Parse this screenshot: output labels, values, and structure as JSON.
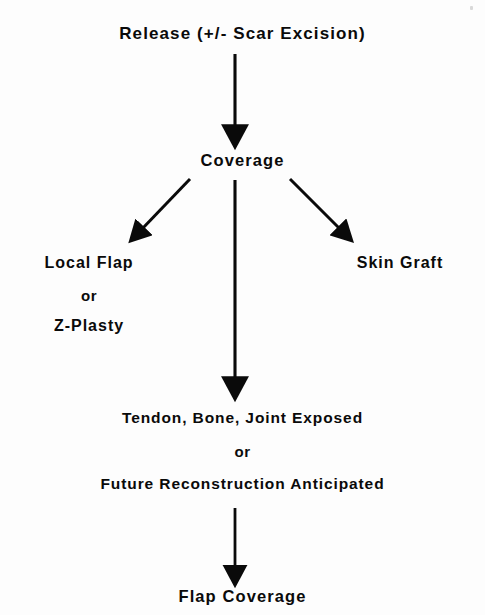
{
  "document": {
    "type": "clinical-algorithm-flowchart",
    "title_text": "Release (+/- Scar Excision)",
    "background_color": "#fdfdfd",
    "ink_color": "#0a0a0a"
  },
  "nodes": {
    "release": {
      "label": "Release (+/- Scar Excision)",
      "center_x": 244,
      "y": 34
    },
    "coverage": {
      "label": "Coverage",
      "center_x": 240,
      "y": 161
    },
    "local_flap": {
      "line1": "Local Flap",
      "line2": "or",
      "line3": "Z-Plasty",
      "center_x": 89,
      "y": 264
    },
    "skin_graft": {
      "label": "Skin Graft",
      "center_x": 400,
      "y": 264
    },
    "exposed": {
      "line1": "Tendon, Bone, Joint Exposed",
      "line2": "or",
      "line3": "Future Reconstruction Anticipated",
      "center_x": 239,
      "y": 418
    },
    "flap_coverage": {
      "label": "Flap Coverage",
      "center_x": 240,
      "y": 596
    }
  },
  "connectors": [
    {
      "name": "release-to-coverage",
      "kind": "vertical-arrow",
      "from": {
        "x": 235,
        "y": 54
      },
      "to": {
        "x": 235,
        "y": 140
      }
    },
    {
      "name": "coverage-to-local-flap",
      "kind": "diagonal-arrow-left",
      "from": {
        "x": 190,
        "y": 179
      },
      "to": {
        "x": 134,
        "y": 238
      }
    },
    {
      "name": "coverage-to-skin-graft",
      "kind": "diagonal-arrow-right",
      "from": {
        "x": 290,
        "y": 179
      },
      "to": {
        "x": 348,
        "y": 238
      }
    },
    {
      "name": "coverage-to-exposed",
      "kind": "vertical-arrow",
      "from": {
        "x": 235,
        "y": 180
      },
      "to": {
        "x": 235,
        "y": 392
      }
    },
    {
      "name": "exposed-to-flap-coverage",
      "kind": "vertical-arrow",
      "from": {
        "x": 235,
        "y": 508
      },
      "to": {
        "x": 235,
        "y": 580
      }
    }
  ],
  "artifacts": {
    "scan_speck": {
      "x": 470,
      "y": 6
    }
  }
}
